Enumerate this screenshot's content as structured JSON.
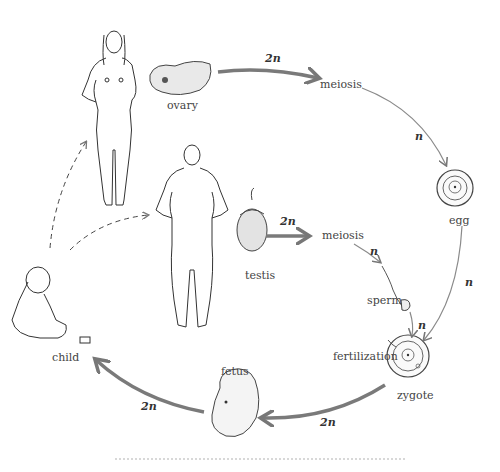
{
  "diagram": {
    "type": "human-life-cycle",
    "organisms": {
      "woman": "adult female",
      "man": "adult male",
      "child": "child"
    },
    "labels": {
      "ovary": "ovary",
      "testis": "testis",
      "meiosis_female": "meiosis",
      "meiosis_male": "meiosis",
      "egg": "egg",
      "sperm": "sperm",
      "fertilization": "fertilization",
      "zygote": "zygote",
      "fetus": "fetus",
      "child": "child"
    },
    "ploidy": {
      "ovary_to_meiosis": "2n",
      "meiosis_to_egg": "n",
      "testis_to_meiosis": "2n",
      "meiosis_to_sperm": "n",
      "egg_to_zygote": "n",
      "sperm_to_zygote": "n",
      "zygote_to_fetus": "2n",
      "fetus_to_child": "2n"
    },
    "colors": {
      "thick_arrow": "#7a7a7a",
      "thin_arrow": "#8a8a8a",
      "line_art": "#333333"
    }
  }
}
